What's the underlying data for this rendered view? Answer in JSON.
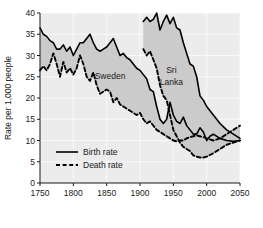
{
  "chart_data": {
    "type": "line",
    "title": "",
    "xlabel": "",
    "ylabel": "Rate per 1,000 people",
    "xlim": [
      1750,
      2050
    ],
    "ylim": [
      0,
      40
    ],
    "xticks": [
      "1750",
      "1800",
      "1850",
      "1900",
      "1950",
      "2000",
      "2050"
    ],
    "yticks": [
      "0",
      "5",
      "10",
      "15",
      "20",
      "25",
      "30",
      "35",
      "40"
    ],
    "grid": true,
    "legend_position": "lower-left-inside",
    "legend": [
      {
        "name": "Birth rate",
        "style": "solid"
      },
      {
        "name": "Death rate",
        "style": "dashed"
      }
    ],
    "annotations": [
      {
        "text": "Sweden",
        "x": 1855,
        "y": 24.5
      },
      {
        "text": "Sri",
        "x": 1947,
        "y": 26.0
      },
      {
        "text": "Lanka",
        "x": 1947,
        "y": 23.0
      }
    ],
    "shaded_band_color": "#c9c9c9",
    "line_color": "#000000",
    "plot_bg_color": "#ececec",
    "series": [
      {
        "name": "Sweden birth rate",
        "style": "solid",
        "x": [
          1750,
          1755,
          1760,
          1765,
          1770,
          1775,
          1780,
          1785,
          1790,
          1795,
          1800,
          1805,
          1810,
          1815,
          1820,
          1825,
          1830,
          1835,
          1840,
          1845,
          1850,
          1855,
          1860,
          1865,
          1870,
          1875,
          1880,
          1885,
          1890,
          1895,
          1900,
          1905,
          1910,
          1915,
          1920,
          1925,
          1930,
          1935,
          1940,
          1945,
          1950,
          1955,
          1960,
          1965,
          1970,
          1975,
          1980,
          1985,
          1990,
          1995,
          2000,
          2005,
          2010,
          2020,
          2030,
          2040,
          2050
        ],
        "y": [
          36.5,
          35.0,
          34.5,
          33.5,
          33.0,
          31.5,
          31.5,
          32.5,
          31.0,
          32.0,
          30.0,
          31.5,
          33.0,
          33.0,
          34.0,
          35.0,
          33.0,
          31.5,
          31.0,
          31.5,
          32.0,
          33.0,
          34.0,
          32.0,
          30.0,
          30.5,
          29.5,
          29.0,
          28.0,
          27.0,
          26.5,
          25.5,
          24.5,
          22.0,
          21.5,
          18.0,
          15.0,
          14.0,
          15.0,
          19.0,
          16.0,
          14.5,
          14.0,
          15.5,
          13.5,
          12.5,
          11.5,
          11.5,
          13.0,
          12.0,
          10.0,
          11.0,
          11.5,
          10.5,
          10.0,
          9.8,
          10.0
        ]
      },
      {
        "name": "Sweden death rate",
        "style": "dashed",
        "x": [
          1750,
          1755,
          1760,
          1765,
          1770,
          1775,
          1780,
          1785,
          1790,
          1795,
          1800,
          1805,
          1810,
          1815,
          1820,
          1825,
          1830,
          1835,
          1840,
          1845,
          1850,
          1855,
          1860,
          1865,
          1870,
          1875,
          1880,
          1885,
          1890,
          1895,
          1900,
          1905,
          1910,
          1915,
          1920,
          1925,
          1930,
          1935,
          1940,
          1945,
          1950,
          1955,
          1960,
          1965,
          1970,
          1975,
          1980,
          1985,
          1990,
          1995,
          2000,
          2010,
          2020,
          2030,
          2040,
          2050
        ],
        "y": [
          26.5,
          27.5,
          26.5,
          28.0,
          30.5,
          28.0,
          25.0,
          28.5,
          26.0,
          27.0,
          25.5,
          27.0,
          30.0,
          28.0,
          25.0,
          24.0,
          26.0,
          23.0,
          21.0,
          21.5,
          22.0,
          21.5,
          19.0,
          20.0,
          18.5,
          18.0,
          17.5,
          17.0,
          16.5,
          16.0,
          16.5,
          15.0,
          14.0,
          14.5,
          13.5,
          12.5,
          12.0,
          11.5,
          11.0,
          10.5,
          10.0,
          9.8,
          10.0,
          10.0,
          10.5,
          10.8,
          11.0,
          11.2,
          11.0,
          10.8,
          10.5,
          10.0,
          10.5,
          11.5,
          12.5,
          13.5
        ]
      },
      {
        "name": "Sri Lanka birth rate",
        "style": "solid",
        "x": [
          1905,
          1910,
          1915,
          1920,
          1925,
          1930,
          1935,
          1940,
          1945,
          1950,
          1955,
          1960,
          1965,
          1970,
          1975,
          1980,
          1985,
          1990,
          1995,
          2000,
          2010,
          2020,
          2030,
          2040,
          2050
        ],
        "y": [
          38.0,
          39.0,
          38.0,
          38.5,
          40.0,
          36.0,
          38.0,
          39.5,
          37.5,
          39.0,
          36.5,
          36.0,
          33.0,
          30.5,
          28.0,
          27.5,
          25.0,
          20.5,
          19.5,
          18.0,
          16.0,
          14.0,
          12.5,
          11.5,
          10.5
        ]
      },
      {
        "name": "Sri Lanka death rate",
        "style": "dashed",
        "x": [
          1905,
          1910,
          1915,
          1920,
          1925,
          1930,
          1935,
          1940,
          1945,
          1950,
          1955,
          1960,
          1965,
          1970,
          1975,
          1980,
          1985,
          1990,
          1995,
          2000,
          2010,
          2020,
          2030,
          2040,
          2050
        ],
        "y": [
          31.5,
          30.0,
          31.0,
          29.0,
          27.0,
          23.0,
          20.5,
          19.5,
          16.0,
          12.5,
          11.0,
          9.5,
          8.5,
          8.0,
          7.5,
          6.5,
          6.2,
          6.0,
          6.0,
          6.2,
          7.0,
          8.0,
          9.0,
          9.5,
          10.0
        ]
      }
    ]
  }
}
